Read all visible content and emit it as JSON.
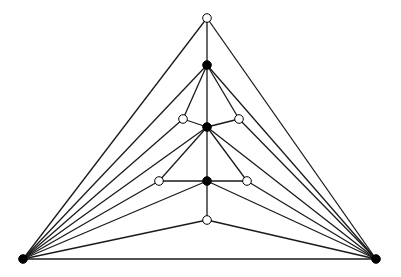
{
  "diagram": {
    "type": "graph",
    "edge_color": "#1a1a1a",
    "node_fill_black": "#000000",
    "node_fill_white": "#ffffff",
    "nodes": [
      {
        "id": "L",
        "x": 23,
        "y": 259,
        "fill": "black"
      },
      {
        "id": "R",
        "x": 376,
        "y": 259,
        "fill": "black"
      },
      {
        "id": "T",
        "x": 207,
        "y": 18,
        "fill": "white"
      },
      {
        "id": "B1",
        "x": 207,
        "y": 65,
        "fill": "black"
      },
      {
        "id": "W1",
        "x": 183,
        "y": 119,
        "fill": "white"
      },
      {
        "id": "W2",
        "x": 239,
        "y": 119,
        "fill": "white"
      },
      {
        "id": "B2",
        "x": 207,
        "y": 127,
        "fill": "black"
      },
      {
        "id": "W3",
        "x": 159,
        "y": 181,
        "fill": "white"
      },
      {
        "id": "W4",
        "x": 247,
        "y": 181,
        "fill": "white"
      },
      {
        "id": "B3",
        "x": 207,
        "y": 181,
        "fill": "black"
      },
      {
        "id": "W5",
        "x": 207,
        "y": 220,
        "fill": "white"
      }
    ],
    "edges": [
      [
        "L",
        "R"
      ],
      [
        "L",
        "T"
      ],
      [
        "R",
        "T"
      ],
      [
        "L",
        "B1"
      ],
      [
        "L",
        "W1"
      ],
      [
        "L",
        "B2"
      ],
      [
        "L",
        "W3"
      ],
      [
        "L",
        "B3"
      ],
      [
        "L",
        "W5"
      ],
      [
        "R",
        "B1"
      ],
      [
        "R",
        "W2"
      ],
      [
        "R",
        "B2"
      ],
      [
        "R",
        "W4"
      ],
      [
        "R",
        "B3"
      ],
      [
        "R",
        "W5"
      ],
      [
        "T",
        "B1"
      ],
      [
        "B1",
        "B2"
      ],
      [
        "B2",
        "B3"
      ],
      [
        "B3",
        "W5"
      ],
      [
        "B1",
        "W1"
      ],
      [
        "B1",
        "W2"
      ],
      [
        "W1",
        "B2"
      ],
      [
        "W2",
        "B2"
      ],
      [
        "B2",
        "W3"
      ],
      [
        "B2",
        "W4"
      ],
      [
        "W3",
        "B3"
      ],
      [
        "W4",
        "B3"
      ]
    ]
  }
}
